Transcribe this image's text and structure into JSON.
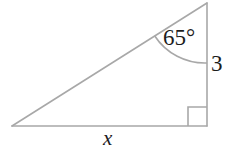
{
  "figure": {
    "name": "right-triangle-trigonometry-diagram",
    "shape": "right triangle",
    "background_color": "#ffffff",
    "stroke_color": "#a8a8a8",
    "text_color": "#1c1c1c",
    "labels": {
      "angle": "65°",
      "opposite_side": "3",
      "adjacent_side": "x"
    },
    "angle_value": 65,
    "angle_unit": "degrees",
    "known_side_length": "3",
    "unknown_side_label": "x",
    "right_angle_vertex": "bottom-right",
    "geometry": {
      "vertex_top": [
        207,
        3
      ],
      "vertex_bottom_right": [
        207,
        126
      ],
      "vertex_bottom_left": [
        12,
        126
      ],
      "right_angle_marker_size": 19,
      "angle_arc_radius": 60
    }
  }
}
